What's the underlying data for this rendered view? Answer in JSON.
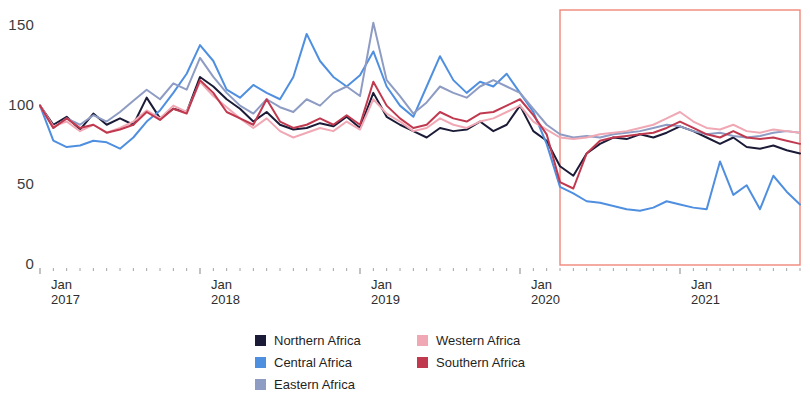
{
  "chart_data": {
    "type": "line",
    "title": "",
    "subtitle": "",
    "xlabel": "",
    "ylabel": "",
    "ylim": [
      0,
      160
    ],
    "yticks": [
      0,
      50,
      100,
      150
    ],
    "ytick_labels": [
      "0",
      "50",
      "100",
      "150"
    ],
    "grid": false,
    "legend_position": "bottom-center",
    "x_axis_type": "monthly",
    "x_start": "2017-01",
    "x_end": "2021-10",
    "xtick_labels": [
      {
        "month": "Jan",
        "year": "2017",
        "index": 0
      },
      {
        "month": "Jan",
        "year": "2018",
        "index": 12
      },
      {
        "month": "Jan",
        "year": "2019",
        "index": 24
      },
      {
        "month": "Jan",
        "year": "2020",
        "index": 36
      },
      {
        "month": "Jan",
        "year": "2021",
        "index": 48
      }
    ],
    "x": [
      "2017-01",
      "2017-02",
      "2017-03",
      "2017-04",
      "2017-05",
      "2017-06",
      "2017-07",
      "2017-08",
      "2017-09",
      "2017-10",
      "2017-11",
      "2017-12",
      "2018-01",
      "2018-02",
      "2018-03",
      "2018-04",
      "2018-05",
      "2018-06",
      "2018-07",
      "2018-08",
      "2018-09",
      "2018-10",
      "2018-11",
      "2018-12",
      "2019-01",
      "2019-02",
      "2019-03",
      "2019-04",
      "2019-05",
      "2019-06",
      "2019-07",
      "2019-08",
      "2019-09",
      "2019-10",
      "2019-11",
      "2019-12",
      "2020-01",
      "2020-02",
      "2020-03",
      "2020-04",
      "2020-05",
      "2020-06",
      "2020-07",
      "2020-08",
      "2020-09",
      "2020-10",
      "2020-11",
      "2020-12",
      "2021-01",
      "2021-02",
      "2021-03",
      "2021-04",
      "2021-05",
      "2021-06",
      "2021-07",
      "2021-08",
      "2021-09",
      "2021-10"
    ],
    "series": [
      {
        "name": "Northern Africa",
        "color": "#1b1b38",
        "values": [
          100,
          88,
          93,
          85,
          95,
          88,
          92,
          88,
          105,
          92,
          98,
          96,
          118,
          112,
          104,
          98,
          90,
          96,
          88,
          85,
          86,
          89,
          87,
          93,
          86,
          108,
          93,
          88,
          84,
          80,
          86,
          84,
          85,
          90,
          84,
          88,
          100,
          84,
          78,
          62,
          56,
          70,
          76,
          80,
          79,
          82,
          80,
          83,
          87,
          84,
          80,
          76,
          80,
          74,
          73,
          75,
          72,
          70
        ]
      },
      {
        "name": "Central Africa",
        "color": "#4f8fe0",
        "values": [
          100,
          78,
          74,
          75,
          78,
          77,
          73,
          80,
          90,
          97,
          108,
          120,
          138,
          128,
          110,
          105,
          113,
          108,
          104,
          118,
          145,
          128,
          118,
          112,
          119,
          134,
          112,
          100,
          93,
          112,
          131,
          116,
          108,
          115,
          112,
          120,
          108,
          96,
          76,
          49,
          45,
          40,
          39,
          37,
          35,
          34,
          36,
          40,
          38,
          36,
          35,
          65,
          44,
          50,
          35,
          56,
          46,
          38
        ]
      },
      {
        "name": "Eastern Africa",
        "color": "#8e9cc4",
        "values": [
          100,
          86,
          92,
          88,
          94,
          90,
          96,
          103,
          110,
          104,
          114,
          110,
          130,
          118,
          108,
          100,
          95,
          104,
          99,
          96,
          104,
          100,
          108,
          112,
          106,
          152,
          116,
          106,
          95,
          102,
          112,
          108,
          105,
          112,
          116,
          112,
          108,
          98,
          88,
          82,
          80,
          81,
          80,
          82,
          83,
          84,
          86,
          88,
          87,
          84,
          82,
          83,
          81,
          80,
          81,
          83,
          84,
          83
        ]
      },
      {
        "name": "Western Africa",
        "color": "#f0a8b4",
        "values": [
          100,
          87,
          90,
          84,
          88,
          83,
          86,
          90,
          97,
          92,
          100,
          96,
          115,
          106,
          99,
          92,
          86,
          92,
          84,
          80,
          83,
          86,
          84,
          90,
          85,
          104,
          95,
          90,
          84,
          86,
          92,
          88,
          86,
          90,
          92,
          96,
          100,
          90,
          85,
          80,
          79,
          80,
          82,
          83,
          84,
          86,
          88,
          92,
          96,
          90,
          86,
          85,
          88,
          84,
          83,
          85,
          84,
          83
        ]
      },
      {
        "name": "Southern Africa",
        "color": "#c0394f",
        "values": [
          100,
          86,
          92,
          86,
          88,
          83,
          85,
          88,
          96,
          91,
          98,
          95,
          116,
          108,
          96,
          92,
          88,
          104,
          90,
          86,
          88,
          92,
          88,
          94,
          88,
          115,
          100,
          92,
          86,
          88,
          96,
          92,
          90,
          95,
          96,
          100,
          104,
          94,
          82,
          52,
          48,
          70,
          78,
          80,
          81,
          82,
          83,
          86,
          90,
          86,
          82,
          80,
          84,
          80,
          79,
          80,
          78,
          76
        ]
      }
    ],
    "annotations": [
      {
        "type": "rectangle",
        "name": "covid-highlight-box",
        "color": "#f0867a",
        "x_start": "2020-04",
        "x_end": "2021-10",
        "y_start": 0,
        "y_end": 160
      }
    ]
  },
  "legend": {
    "columns": [
      {
        "items": [
          {
            "label": "Northern Africa",
            "color": "#1b1b38"
          },
          {
            "label": "Central Africa",
            "color": "#4f8fe0"
          },
          {
            "label": "Eastern Africa",
            "color": "#8e9cc4"
          }
        ]
      },
      {
        "items": [
          {
            "label": "Western Africa",
            "color": "#f0a8b4"
          },
          {
            "label": "Southern Africa",
            "color": "#c0394f"
          }
        ]
      }
    ]
  }
}
